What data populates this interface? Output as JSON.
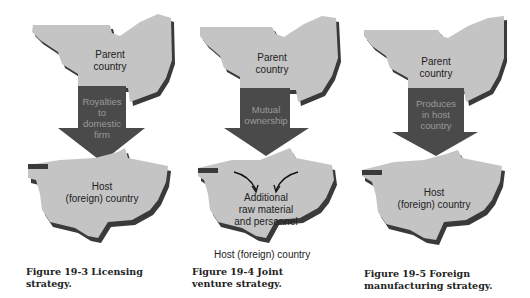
{
  "colors": {
    "land": "#c4c4c4",
    "land_shadow": "#3a3a3a",
    "arrow": "#4a4a4a",
    "arrow_text": "#9a9a9a",
    "text": "#222222"
  },
  "figures": [
    {
      "parent_label": "Parent country",
      "arrow_label": "Royalties to domestic firm",
      "host_label": "Host (foreign) country",
      "caption": "Figure 19-3   Licensing strategy."
    },
    {
      "parent_label": "Parent country",
      "arrow_label": "Mutual ownership",
      "host_inner_label": "Additional raw material and personnel",
      "host_label": "Host (foreign) country",
      "caption": "Figure 19-4   Joint venture strategy."
    },
    {
      "parent_label": "Parent country",
      "arrow_label": "Produces in host country",
      "host_label": "Host (foreign) country",
      "caption": "Figure 19-5   Foreign manufacturing strategy."
    }
  ],
  "text": {
    "f0_parent_1": "Parent",
    "f0_parent_2": "country",
    "f0_arrow_1": "Royalties",
    "f0_arrow_2": "to",
    "f0_arrow_3": "domestic",
    "f0_arrow_4": "firm",
    "f0_host_1": "Host",
    "f0_host_2": "(foreign) country",
    "f0_cap_1": "Figure 19-3   Licensing",
    "f0_cap_2": "strategy.",
    "f1_parent_1": "Parent",
    "f1_parent_2": "country",
    "f1_arrow_1": "Mutual",
    "f1_arrow_2": "ownership",
    "f1_inner_1": "Additional",
    "f1_inner_2": "raw material",
    "f1_inner_3": "and personnel",
    "f1_host": "Host (foreign) country",
    "f1_cap_1": "Figure 19-4   Joint",
    "f1_cap_2": "venture strategy.",
    "f2_parent_1": "Parent",
    "f2_parent_2": "country",
    "f2_arrow_1": "Produces",
    "f2_arrow_2": "in host",
    "f2_arrow_3": "country",
    "f2_host_1": "Host",
    "f2_host_2": "(foreign) country",
    "f2_cap_1": "Figure 19-5   Foreign",
    "f2_cap_2": "manufacturing strategy."
  }
}
